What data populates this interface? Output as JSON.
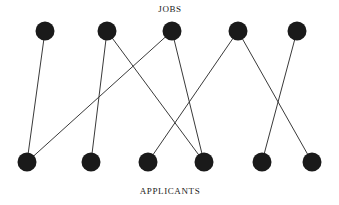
{
  "diagram": {
    "type": "bipartite-graph",
    "width": 339,
    "height": 205,
    "background_color": "#ffffff",
    "node_color": "#1a1a1a",
    "edge_color": "#3a3a3a",
    "node_radius": 9.5,
    "edge_width": 1,
    "top_label": "JOBS",
    "bottom_label": "APPLICANTS",
    "top_nodes": [
      {
        "id": "J1",
        "x": 45,
        "y": 31
      },
      {
        "id": "J2",
        "x": 107,
        "y": 31
      },
      {
        "id": "J3",
        "x": 172,
        "y": 31
      },
      {
        "id": "J4",
        "x": 238,
        "y": 31
      },
      {
        "id": "J5",
        "x": 297,
        "y": 31
      }
    ],
    "bottom_nodes": [
      {
        "id": "A1",
        "x": 27,
        "y": 162
      },
      {
        "id": "A2",
        "x": 91,
        "y": 162
      },
      {
        "id": "A3",
        "x": 148,
        "y": 162
      },
      {
        "id": "A4",
        "x": 204,
        "y": 162
      },
      {
        "id": "A5",
        "x": 262,
        "y": 162
      },
      {
        "id": "A6",
        "x": 312,
        "y": 162
      }
    ],
    "edges": [
      {
        "from": "J1",
        "to": "A1"
      },
      {
        "from": "J2",
        "to": "A2"
      },
      {
        "from": "J2",
        "to": "A4"
      },
      {
        "from": "J3",
        "to": "A1"
      },
      {
        "from": "J3",
        "to": "A4"
      },
      {
        "from": "J4",
        "to": "A3"
      },
      {
        "from": "J4",
        "to": "A6"
      },
      {
        "from": "J5",
        "to": "A5"
      }
    ]
  }
}
